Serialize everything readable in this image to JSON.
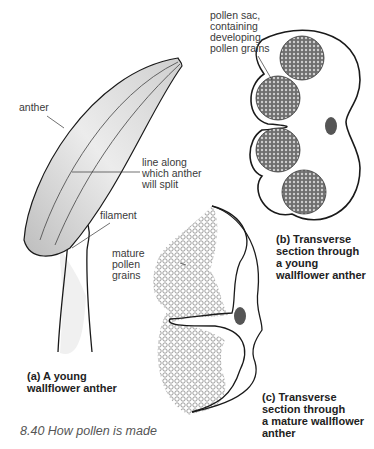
{
  "figure": {
    "caption": "8.40 How pollen is made",
    "parts": {
      "a": {
        "caption": "(a) A young\nwallflower anther",
        "labels": {
          "anther": "anther",
          "split_line": "line along\nwhich anther\nwill split",
          "filament": "filament"
        }
      },
      "b": {
        "caption": "(b) Transverse\nsection through\na young\nwallflower anther",
        "labels": {
          "pollen_sac": "pollen sac,\ncontaining\ndeveloping\npollen grains"
        }
      },
      "c": {
        "caption": "(c) Transverse\nsection through\na mature wallflower\nanther",
        "labels": {
          "mature_pollen": "mature\npollen\ngrains"
        }
      }
    },
    "colors": {
      "outline": "#1a1a1a",
      "vascular_bundle": "#555555",
      "pollen_sac_fill": "#7a7a7a",
      "anther_shade": "#d8d8d8"
    }
  }
}
